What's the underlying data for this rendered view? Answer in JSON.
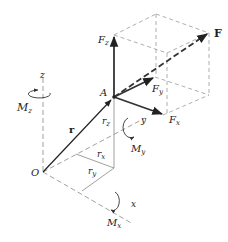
{
  "diagram": {
    "points": {
      "O": {
        "label": "O"
      },
      "A": {
        "label": "A"
      }
    },
    "vectors": {
      "position": {
        "label": "r",
        "bold": true
      },
      "force": {
        "label": "F",
        "bold": true
      },
      "force_x": {
        "base": "F",
        "sub": "x"
      },
      "force_y": {
        "base": "F",
        "sub": "y"
      },
      "force_z": {
        "base": "F",
        "sub": "z"
      }
    },
    "position_components": {
      "rx": {
        "base": "r",
        "sub": "x"
      },
      "ry": {
        "base": "r",
        "sub": "y"
      },
      "rz": {
        "base": "r",
        "sub": "z"
      }
    },
    "axes": {
      "x": "x",
      "y": "y",
      "z": "z"
    },
    "moments": {
      "Mx": {
        "base": "M",
        "sub": "x"
      },
      "My": {
        "base": "M",
        "sub": "y"
      },
      "Mz": {
        "base": "M",
        "sub": "z"
      }
    },
    "colors": {
      "ink": "#222222",
      "dashed": "#9a9a9a",
      "thin": "#888888"
    }
  }
}
